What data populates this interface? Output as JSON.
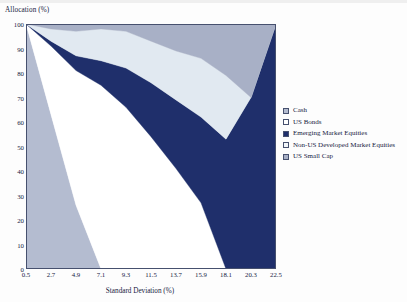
{
  "chart_data": {
    "type": "area",
    "stacked": true,
    "title": "",
    "xlabel": "Standard Deviation (%)",
    "ylabel": "Allocation (%)",
    "xlim": [
      0.5,
      22.5
    ],
    "ylim": [
      0,
      100
    ],
    "grid": false,
    "legend_position": "right",
    "x_ticks": [
      "0.5",
      "2.7",
      "4.9",
      "7.1",
      "9.3",
      "11.5",
      "13.7",
      "15.9",
      "18.1",
      "20.3",
      "22.5"
    ],
    "y_ticks": [
      "0",
      "10",
      "20",
      "30",
      "40",
      "50",
      "60",
      "70",
      "80",
      "90",
      "100"
    ],
    "x": [
      0.5,
      2.7,
      4.9,
      7.1,
      9.3,
      11.5,
      13.7,
      15.9,
      18.1,
      20.3,
      22.5
    ],
    "series": [
      {
        "name": "Cash",
        "color": "#b4bcd0",
        "values": [
          100,
          63,
          26,
          0,
          0,
          0,
          0,
          0,
          0,
          0,
          0
        ]
      },
      {
        "name": "US Bonds",
        "color": "#ffffff",
        "values": [
          0,
          28,
          55,
          75,
          66,
          54,
          41,
          27,
          0,
          0,
          0
        ]
      },
      {
        "name": "Emerging Market Equities",
        "color": "#1f2f6b",
        "values": [
          0,
          2,
          6,
          10,
          16,
          22,
          28,
          35,
          53,
          70,
          100
        ]
      },
      {
        "name": "Non-US Developed Market Equities",
        "color": "#e1e9f1",
        "values": [
          0,
          5,
          10,
          13,
          15,
          17,
          20,
          24,
          26,
          0,
          0
        ]
      },
      {
        "name": "US Small Cap",
        "color": "#a8b0c6",
        "values": [
          0,
          2,
          3,
          2,
          3,
          7,
          11,
          14,
          21,
          30,
          0
        ]
      }
    ]
  },
  "axes": {
    "y_axis_title": "Allocation (%)",
    "x_axis_title": "Standard Deviation (%)"
  },
  "legend": {
    "items": [
      {
        "label": "Cash",
        "color": "#b4bcd0"
      },
      {
        "label": "US Bonds",
        "color": "#ffffff"
      },
      {
        "label": "Emerging Market Equities",
        "color": "#1f2f6b"
      },
      {
        "label": "Non-US Developed Market Equities",
        "color": "#f2f6fa"
      },
      {
        "label": "US Small Cap",
        "color": "#a8b0c6"
      }
    ]
  }
}
